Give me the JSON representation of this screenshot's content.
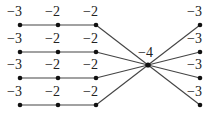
{
  "diagram": {
    "type": "weighted-graph",
    "nodes": [
      {
        "id": "a1",
        "label": "−3",
        "x": 20,
        "y": 25
      },
      {
        "id": "b1",
        "label": "−2",
        "x": 58,
        "y": 25
      },
      {
        "id": "c1",
        "label": "−2",
        "x": 96,
        "y": 25
      },
      {
        "id": "a2",
        "label": "−3",
        "x": 20,
        "y": 52
      },
      {
        "id": "b2",
        "label": "−2",
        "x": 58,
        "y": 52
      },
      {
        "id": "c2",
        "label": "−2",
        "x": 96,
        "y": 52
      },
      {
        "id": "a3",
        "label": "−3",
        "x": 20,
        "y": 78
      },
      {
        "id": "b3",
        "label": "−2",
        "x": 58,
        "y": 78
      },
      {
        "id": "c3",
        "label": "−2",
        "x": 96,
        "y": 78
      },
      {
        "id": "a4",
        "label": "−3",
        "x": 20,
        "y": 105
      },
      {
        "id": "b4",
        "label": "−2",
        "x": 58,
        "y": 105
      },
      {
        "id": "c4",
        "label": "−2",
        "x": 96,
        "y": 105
      },
      {
        "id": "center",
        "label": "−4",
        "x": 148,
        "y": 65
      },
      {
        "id": "r1",
        "label": "−3",
        "x": 200,
        "y": 25
      },
      {
        "id": "r2",
        "label": "−3",
        "x": 200,
        "y": 52
      },
      {
        "id": "r3",
        "label": "−3",
        "x": 200,
        "y": 78
      },
      {
        "id": "r4",
        "label": "−3",
        "x": 200,
        "y": 105
      }
    ],
    "edges": [
      [
        "a1",
        "b1"
      ],
      [
        "b1",
        "c1"
      ],
      [
        "c1",
        "center"
      ],
      [
        "a2",
        "b2"
      ],
      [
        "b2",
        "c2"
      ],
      [
        "c2",
        "center"
      ],
      [
        "a3",
        "b3"
      ],
      [
        "b3",
        "c3"
      ],
      [
        "c3",
        "center"
      ],
      [
        "a4",
        "b4"
      ],
      [
        "b4",
        "c4"
      ],
      [
        "c4",
        "center"
      ],
      [
        "center",
        "r1"
      ],
      [
        "center",
        "r2"
      ],
      [
        "center",
        "r3"
      ],
      [
        "center",
        "r4"
      ]
    ],
    "colors": {
      "edge": "#444444",
      "node": "#111111",
      "label": "#222222"
    }
  }
}
